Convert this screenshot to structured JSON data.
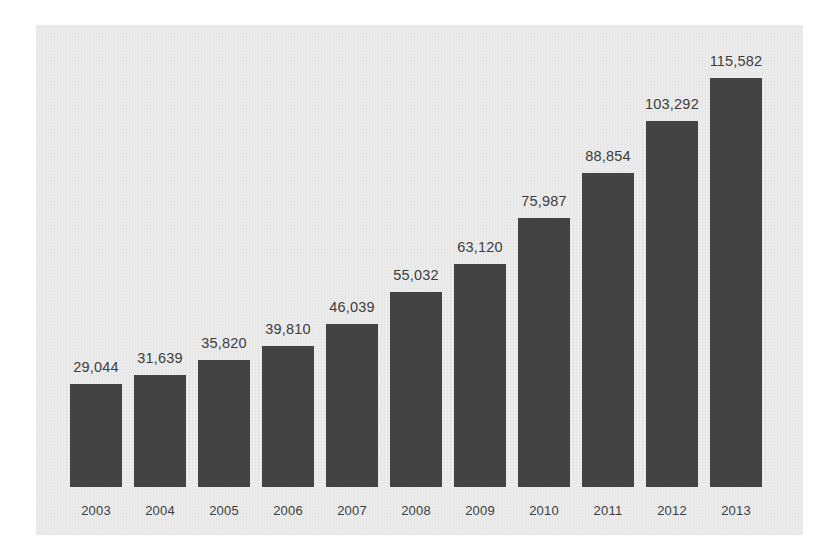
{
  "chart_data": {
    "type": "bar",
    "title": "",
    "subtitle": "",
    "xlabel": "",
    "ylabel": "",
    "categories": [
      "2003",
      "2004",
      "2005",
      "2006",
      "2007",
      "2008",
      "2009",
      "2010",
      "2011",
      "2012",
      "2013"
    ],
    "values": [
      29044,
      31639,
      35820,
      39810,
      46039,
      55032,
      63120,
      75987,
      88854,
      103292,
      115582
    ],
    "value_labels": [
      "29,044",
      "31,639",
      "35,820",
      "39,810",
      "46,039",
      "55,032",
      "63,120",
      "75,987",
      "88,854",
      "103,292",
      "115,582"
    ],
    "ylim": [
      0,
      115582
    ],
    "grid": false,
    "legend": null,
    "axis_visible": false,
    "data_labels_shown": true,
    "annotations": []
  },
  "style": {
    "bar_color": "#434343",
    "panel_background": "#ececec",
    "page_background": "#ffffff",
    "label_color": "#3d3d3d"
  }
}
